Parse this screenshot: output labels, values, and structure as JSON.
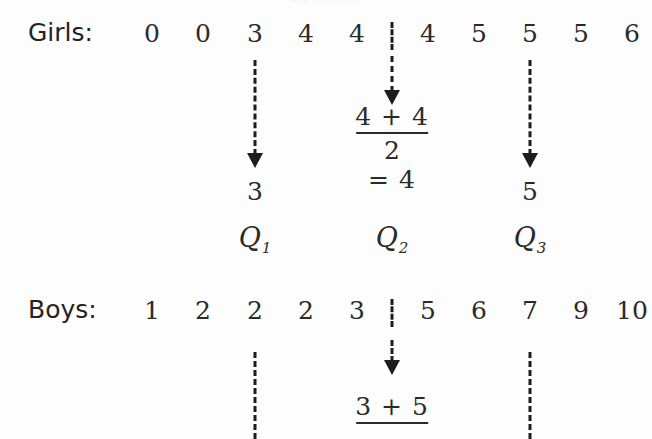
{
  "figure": {
    "top_clipped_caption": "Example",
    "background_color": "#fdfdfd",
    "ink_color": "#2a2a2a"
  },
  "girls": {
    "label": "Girls:",
    "values": [
      "0",
      "0",
      "3",
      "4",
      "4",
      "4",
      "5",
      "5",
      "5",
      "6"
    ],
    "q1_result": "3",
    "q3_result": "5",
    "median": {
      "numerator": "4 + 4",
      "denominator": "2",
      "equals": "= 4"
    }
  },
  "quartile_labels": [
    {
      "base": "Q",
      "sub": "1"
    },
    {
      "base": "Q",
      "sub": "2"
    },
    {
      "base": "Q",
      "sub": "3"
    }
  ],
  "boys": {
    "label": "Boys:",
    "values": [
      "1",
      "2",
      "2",
      "2",
      "3",
      "5",
      "6",
      "7",
      "9",
      "10"
    ],
    "median": {
      "numerator": "3 + 5"
    }
  }
}
